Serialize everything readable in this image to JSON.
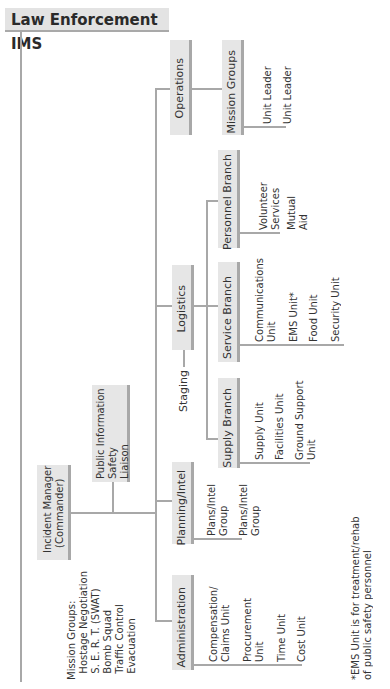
{
  "title": "Law Enforcement IMS",
  "commander": {
    "label": "Incident Manager\n(Commander)"
  },
  "command_staff": {
    "label": "Public Information\nSafety\nLiaison"
  },
  "mission_groups_note": {
    "label": "Mission Groups:\n  Hostage Negotiation\n  S. E. R. T. (SWAT)\n  Bomb Squad\n  Traffic Control\n  Evacuation"
  },
  "sections": {
    "administration": {
      "label": "Administration",
      "units": [
        "Compensation/\nClaims Unit",
        "Procurement\nUnit",
        "Time Unit",
        "Cost Unit"
      ]
    },
    "planning": {
      "label": "Planning/Intel",
      "units": [
        "Plans/Intel\nGroup",
        "Plans/Intel\nGroup"
      ]
    },
    "logistics": {
      "label": "Logistics",
      "staging": "Staging",
      "branches": {
        "supply": {
          "label": "Supply Branch",
          "units": [
            "Supply Unit",
            "Facilities Unit",
            "Ground Support\nUnit"
          ]
        },
        "service": {
          "label": "Service Branch",
          "units": [
            "Communications\nUnit",
            "EMS Unit*",
            "Food Unit",
            "Security Unit"
          ]
        },
        "personnel": {
          "label": "Personnel Branch",
          "units": [
            "Volunteer\nServices",
            "Mutual\nAid"
          ]
        }
      }
    },
    "operations": {
      "label": "Operations",
      "branches": {
        "mission_groups": {
          "label": "Mission Groups",
          "units": [
            "Unit Leader",
            "Unit Leader"
          ]
        }
      }
    }
  },
  "footnote": "*EMS Unit is for treatment/rehab\nof public safety personnel"
}
